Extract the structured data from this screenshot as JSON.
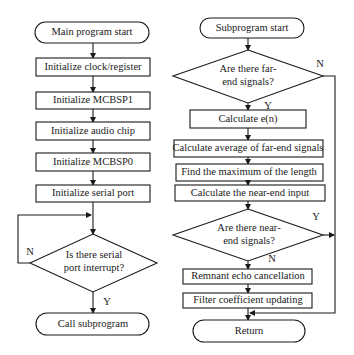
{
  "main_flow": {
    "start": "Main program start",
    "steps": [
      "Initialize clock/register",
      "Initialize MCBSP1",
      "Initialize audio chip",
      "Initialize MCBSP0",
      "Initialize serial port"
    ],
    "decision": {
      "line1": "Is there serial",
      "line2": "port interrupt?",
      "no_label": "N",
      "yes_label": "Y"
    },
    "end": "Call subprogram"
  },
  "sub_flow": {
    "start": "Subprogram start",
    "decision_far": {
      "line1": "Are there far-",
      "line2": "end signals?",
      "no_label": "N",
      "yes_label": "Y"
    },
    "steps": [
      "Calculate e(n)",
      "Calculate average of far-end signals",
      "Find the maximum of the length",
      "Calculate the near-end input"
    ],
    "decision_near": {
      "line1": "Are there near-",
      "line2": "end signals?",
      "yes_label": "Y",
      "no_label": "N"
    },
    "steps_after": [
      "Remnant echo cancellation",
      "Filter coefficient updating"
    ],
    "end": "Return"
  }
}
